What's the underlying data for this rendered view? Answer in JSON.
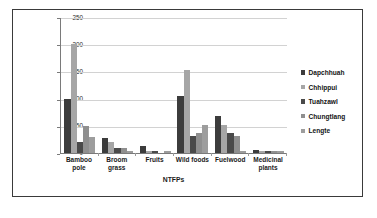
{
  "chart_data": {
    "type": "bar",
    "title": "",
    "xlabel": "NTFPs",
    "ylabel": "Quantity of NTFPs harvest (kg/hh/year)",
    "ylim": [
      0,
      250
    ],
    "yticks": [
      0,
      50,
      100,
      150,
      200,
      250
    ],
    "grid": true,
    "legend_position": "right",
    "categories": [
      "Bamboo pole",
      "Broom grass",
      "Fruits",
      "Wild foods",
      "Fuelwood",
      "Medicinal plants"
    ],
    "series": [
      {
        "name": "Dapchhuah",
        "color": "#3c3c3c",
        "values": [
          100,
          28,
          12,
          105,
          68,
          5
        ]
      },
      {
        "name": "Chhippui",
        "color": "#a6a6a6",
        "values": [
          200,
          20,
          3,
          152,
          52,
          4
        ]
      },
      {
        "name": "Tuahzawl",
        "color": "#4a4a4a",
        "values": [
          20,
          10,
          3,
          31,
          36,
          4
        ]
      },
      {
        "name": "Chungtlang",
        "color": "#8f8f8f",
        "values": [
          50,
          9,
          0,
          36,
          32,
          3
        ]
      },
      {
        "name": "Lengte",
        "color": "#9d9d9d",
        "values": [
          30,
          4,
          3,
          51,
          3,
          3
        ]
      }
    ]
  },
  "axis": {
    "y_title": "Quantity of NTFPs harvest (kg/hh/year)",
    "x_title": "NTFPs",
    "y_tick_labels": [
      "250",
      "200",
      "150",
      "100",
      "50",
      "0"
    ]
  },
  "legend": {
    "items": [
      {
        "label": "Dapchhuah"
      },
      {
        "label": "Chhippui"
      },
      {
        "label": "Tuahzawl"
      },
      {
        "label": "Chungtlang"
      },
      {
        "label": "Lengte"
      }
    ]
  },
  "x_axis_labels": [
    {
      "line1": "Bamboo",
      "line2": "pole"
    },
    {
      "line1": "Broom",
      "line2": "grass"
    },
    {
      "line1": "Fruits",
      "line2": ""
    },
    {
      "line1": "Wild foods",
      "line2": ""
    },
    {
      "line1": "Fuelwood",
      "line2": ""
    },
    {
      "line1": "Medicinal",
      "line2": "plants"
    }
  ],
  "caption": {
    "line1": "",
    "line2": ""
  }
}
